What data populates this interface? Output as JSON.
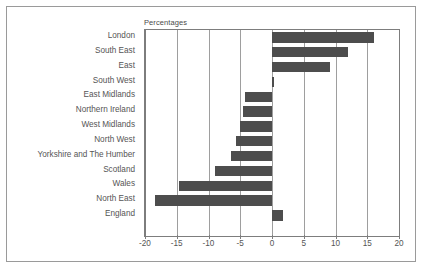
{
  "chart_data": {
    "type": "bar",
    "orientation": "horizontal",
    "title": "Percentages",
    "xlabel": "",
    "ylabel": "",
    "xlim": [
      -20,
      20
    ],
    "xticks": [
      -20,
      -15,
      -10,
      -5,
      0,
      5,
      10,
      15,
      20
    ],
    "xtick_labels": [
      "-20",
      "-15",
      "-10",
      "-5",
      "0",
      "5",
      "10",
      "15",
      "20"
    ],
    "grid": true,
    "legend": false,
    "bar_color": "#4d4d4d",
    "categories": [
      "London",
      "South East",
      "East",
      "South West",
      "East Midlands",
      "Northern Ireland",
      "West Midlands",
      "North West",
      "Yorkshire and The Humber",
      "Scotland",
      "Wales",
      "North East",
      "England"
    ],
    "values": [
      16.0,
      11.9,
      9.2,
      0.3,
      -4.2,
      -4.6,
      -5.1,
      -5.7,
      -6.4,
      -8.9,
      -14.7,
      -18.4,
      1.8
    ]
  }
}
